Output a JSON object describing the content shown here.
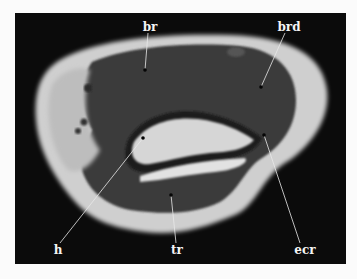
{
  "figure": {
    "background": "#0b0b0b",
    "labels": [
      {
        "key": "br",
        "text": "br",
        "label_pos": [
          150,
          27
        ],
        "point": [
          145,
          70
        ]
      },
      {
        "key": "brd",
        "text": "brd",
        "label_pos": [
          289,
          27
        ],
        "point": [
          261,
          87
        ]
      },
      {
        "key": "h",
        "text": "h",
        "label_pos": [
          58,
          250
        ],
        "point": [
          143,
          138
        ]
      },
      {
        "key": "tr",
        "text": "tr",
        "label_pos": [
          177,
          250
        ],
        "point": [
          171,
          195
        ]
      },
      {
        "key": "ecr",
        "text": "ecr",
        "label_pos": [
          305,
          250
        ],
        "point": [
          264,
          135
        ]
      }
    ]
  }
}
